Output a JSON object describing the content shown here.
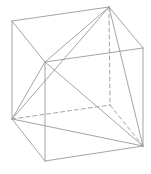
{
  "diagram": {
    "width": 151,
    "height": 174,
    "stroke_color": "#9a9a9a",
    "vertices": {
      "A": [
        12,
        21
      ],
      "B": [
        109,
        7
      ],
      "C": [
        143,
        48
      ],
      "D": [
        45,
        62
      ],
      "E": [
        12,
        119
      ],
      "F": [
        110,
        105
      ],
      "G": [
        143,
        146
      ],
      "H": [
        45,
        161
      ]
    },
    "edges": [
      {
        "from": "A",
        "to": "B",
        "style": "solid",
        "kind": "cube-edge"
      },
      {
        "from": "B",
        "to": "C",
        "style": "solid",
        "kind": "cube-edge"
      },
      {
        "from": "C",
        "to": "D",
        "style": "solid",
        "kind": "cube-edge"
      },
      {
        "from": "D",
        "to": "A",
        "style": "solid",
        "kind": "cube-edge"
      },
      {
        "from": "A",
        "to": "E",
        "style": "solid",
        "kind": "cube-edge"
      },
      {
        "from": "D",
        "to": "H",
        "style": "solid",
        "kind": "cube-edge"
      },
      {
        "from": "C",
        "to": "G",
        "style": "solid",
        "kind": "cube-edge"
      },
      {
        "from": "E",
        "to": "H",
        "style": "solid",
        "kind": "cube-edge"
      },
      {
        "from": "H",
        "to": "G",
        "style": "solid",
        "kind": "cube-edge"
      },
      {
        "from": "B",
        "to": "F",
        "style": "dashed",
        "kind": "hidden-edge"
      },
      {
        "from": "E",
        "to": "F",
        "style": "dashed",
        "kind": "hidden-edge"
      },
      {
        "from": "F",
        "to": "G",
        "style": "dashed",
        "kind": "hidden-edge"
      },
      {
        "from": "B",
        "to": "D",
        "style": "solid",
        "kind": "tetra-edge"
      },
      {
        "from": "B",
        "to": "E",
        "style": "solid",
        "kind": "tetra-edge"
      },
      {
        "from": "B",
        "to": "G",
        "style": "solid",
        "kind": "tetra-edge"
      },
      {
        "from": "D",
        "to": "E",
        "style": "solid",
        "kind": "tetra-edge"
      },
      {
        "from": "D",
        "to": "G",
        "style": "solid",
        "kind": "tetra-edge"
      },
      {
        "from": "E",
        "to": "G",
        "style": "solid",
        "kind": "tetra-edge"
      }
    ]
  }
}
